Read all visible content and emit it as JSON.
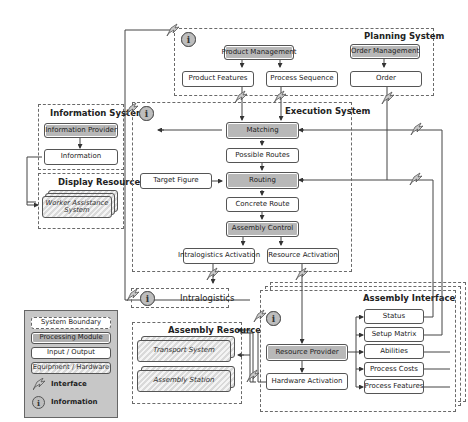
{
  "boundaries": {
    "planning": {
      "title": "Planning System"
    },
    "information": {
      "title": "Information System"
    },
    "display": {
      "title": "Display Resources"
    },
    "execution": {
      "title": "Execution System"
    },
    "intralogistics": {
      "title": "Intralogistics"
    },
    "assembly_resources": {
      "title": "Assembly Resources"
    },
    "assembly_interface": {
      "title": "Assembly Interface"
    }
  },
  "planning": {
    "product_management": "Product Management",
    "order_management": "Order Management",
    "product_features": "Product Features",
    "process_sequence": "Process Sequence",
    "order": "Order"
  },
  "information_system": {
    "provider": "Information Provider",
    "information": "Information"
  },
  "display": {
    "worker_assistance": "Worker Assistance System"
  },
  "execution": {
    "matching": "Matching",
    "possible_routes": "Possible Routes",
    "target_figure": "Target Figure",
    "routing": "Routing",
    "concrete_route": "Concrete Route",
    "assembly_control": "Assembly Control",
    "intralogistics_activation": "Intralogistics Activation",
    "resource_activation": "Resource Activation"
  },
  "assembly_resources": {
    "transport_system": "Transport System",
    "assembly_station": "Assembly Station"
  },
  "assembly_interface": {
    "resource_provider": "Resource Provider",
    "hardware_activation": "Hardware Activation",
    "status": "Status",
    "setup_matrix": "Setup Matrix",
    "abilities": "Abilities",
    "process_costs": "Process Costs",
    "process_features": "Process Features"
  },
  "legend": {
    "system_boundary": "System Boundary",
    "processing_module": "Processing Module",
    "input_output": "Input / Output",
    "equipment_hardware": "Equipment / Hardware",
    "interface": "Interface",
    "information": "Information"
  },
  "icons": {
    "info_glyph": "i"
  },
  "colors": {
    "processing_module": "#b8b8b8",
    "legend_background": "#c7c7c7",
    "line": "#444444"
  }
}
